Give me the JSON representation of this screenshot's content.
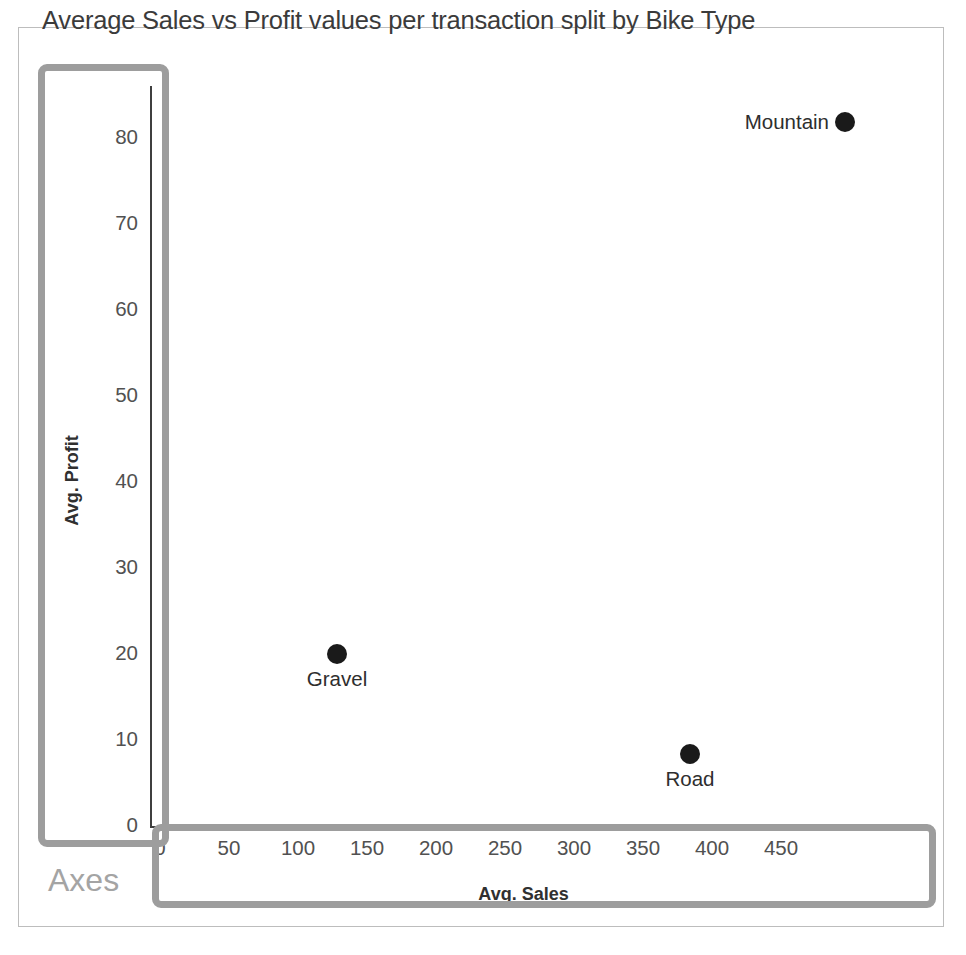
{
  "figure": {
    "title": "Average Sales vs Profit values per transaction split by Bike Type",
    "background_color": "#ffffff",
    "border_color": "#bdbdbd"
  },
  "annotations": {
    "axes_label": "Axes",
    "box_color": "#9d9d9d",
    "label_color": "#a4a4a4"
  },
  "chart_data": {
    "type": "scatter",
    "title": "Average Sales vs Profit values per transaction split by Bike Type",
    "xlabel": "Avg. Sales",
    "ylabel": "Avg. Profit",
    "xlim": [
      0,
      485
    ],
    "ylim": [
      0,
      84
    ],
    "xticks": [
      0,
      50,
      100,
      150,
      200,
      250,
      300,
      350,
      400,
      450
    ],
    "yticks": [
      0,
      10,
      20,
      30,
      40,
      50,
      60,
      70,
      80
    ],
    "xticklabels": [
      "0",
      "50",
      "100",
      "150",
      "200",
      "250",
      "300",
      "350",
      "400",
      "450"
    ],
    "yticklabels": [
      "0",
      "10",
      "20",
      "30",
      "40",
      "50",
      "60",
      "70",
      "80"
    ],
    "grid": false,
    "legend": "none",
    "marker_color": "#1a1a1a",
    "points": [
      {
        "label": "Mountain",
        "x": 497,
        "y": 81.8,
        "label_position": "left",
        "px": 845,
        "py": 122
      },
      {
        "label": "Gravel",
        "x": 128,
        "y": 20.0,
        "label_position": "below",
        "px": 337,
        "py": 654
      },
      {
        "label": "Road",
        "x": 384,
        "y": 8.4,
        "label_position": "below",
        "px": 690,
        "py": 754
      }
    ]
  }
}
